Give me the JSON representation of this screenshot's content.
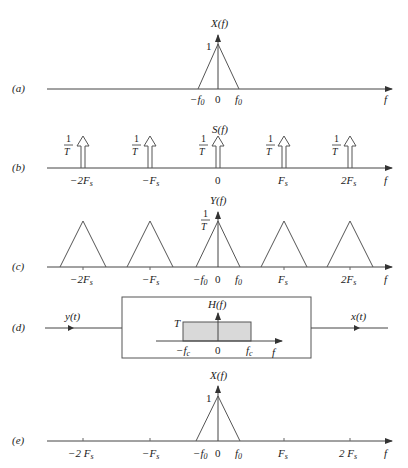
{
  "panels": {
    "a": {
      "label": "(a)",
      "ylabel": "X(f)",
      "peak_label": "1",
      "ticks": [
        "−f",
        "0",
        "f"
      ],
      "tick_subs": [
        "0",
        "",
        "0"
      ],
      "xlabel": "f"
    },
    "b": {
      "label": "(b)",
      "ylabel": "S(f)",
      "impulse_num": "1",
      "impulse_den": "T",
      "ticks": [
        "−2F",
        "−F",
        "0",
        "F",
        "2F"
      ],
      "tick_subs": [
        "s",
        "s",
        "",
        "s",
        "s"
      ],
      "xlabel": "f"
    },
    "c": {
      "label": "(c)",
      "ylabel": "Y(f)",
      "peak_num": "1",
      "peak_den": "T",
      "ticks": [
        "−2F",
        "−F",
        "−f",
        "0",
        "f",
        "F",
        "2F"
      ],
      "tick_subs": [
        "s",
        "s",
        "0",
        "",
        "0",
        "s",
        "s"
      ],
      "xlabel": "f"
    },
    "d": {
      "label": "(d)",
      "input_label": "y(t)",
      "output_label": "x(t)",
      "filter_ylabel": "H(f)",
      "filter_gain": "T",
      "ticks": [
        "−f",
        "0",
        "f"
      ],
      "tick_subs": [
        "c",
        "",
        "c"
      ],
      "xlabel": "f"
    },
    "e": {
      "label": "(e)",
      "ylabel": "X(f)",
      "peak_label": "1",
      "ticks": [
        "−2 F",
        "−F",
        "−f",
        "0",
        "f",
        "F",
        "2 F"
      ],
      "tick_subs": [
        "s",
        "s",
        "0",
        "",
        "0",
        "s",
        "s"
      ],
      "xlabel": "f"
    }
  },
  "colors": {
    "line": "#555555",
    "filter_fill": "#d9d9d9",
    "text": "#222222"
  }
}
